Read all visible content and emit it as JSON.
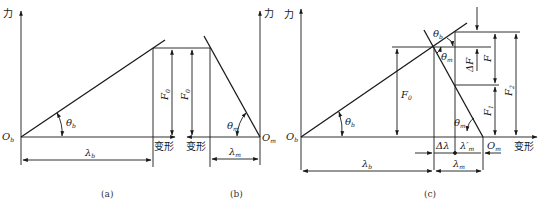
{
  "figure": {
    "panels": [
      {
        "id": "a",
        "caption": "(a)"
      },
      {
        "id": "b",
        "caption": "(b)"
      },
      {
        "id": "c",
        "caption": "(c)"
      }
    ],
    "axis_labels": {
      "force": "力",
      "deformation": "变形"
    },
    "panel_a": {
      "origin": "O",
      "origin_sub": "b",
      "angle": "θ",
      "angle_sub": "b",
      "force": "F",
      "force_sub": "0",
      "length": "λ",
      "length_sub": "b",
      "x_label": "变形"
    },
    "panel_b": {
      "origin": "O",
      "origin_sub": "m",
      "angle": "θ",
      "angle_sub": "m",
      "force": "F",
      "force_sub": "0",
      "length": "λ",
      "length_sub": "m",
      "x_label": "变形"
    },
    "panel_c": {
      "origin_b": "O",
      "origin_b_sub": "b",
      "origin_m": "O",
      "origin_m_sub": "m",
      "theta_b_low": "θ",
      "theta_b_low_sub": "b",
      "theta_b_high": "θ",
      "theta_b_high_sub": "b",
      "theta_m_high": "θ",
      "theta_m_high_sub": "m",
      "theta_m_low": "θ",
      "theta_m_low_sub": "m",
      "F0": "F",
      "F0_sub": "0",
      "dF": "ΔF",
      "F": "F",
      "F1": "F",
      "F1_sub": "1",
      "F2": "F",
      "F2_sub": "2",
      "delta_lambda": "Δλ",
      "lambda_m_prime": "λ′",
      "lambda_m_prime_sub": "m",
      "lambda_b": "λ",
      "lambda_b_sub": "b",
      "lambda_m": "λ",
      "lambda_m_sub": "m",
      "x_label": "变形",
      "y_label": "力"
    }
  }
}
